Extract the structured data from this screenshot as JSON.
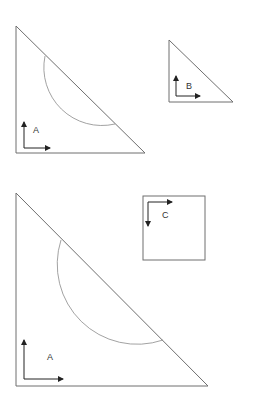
{
  "diagram": {
    "figures": [
      {
        "id": "triangle-a-small",
        "type": "right-triangle",
        "label": "A",
        "points": [
          [
            16,
            26
          ],
          [
            16,
            153
          ],
          [
            145,
            153
          ]
        ],
        "arc": {
          "from": [
            45,
            56
          ],
          "to": [
            115,
            124
          ]
        },
        "axes": {
          "origin": [
            24,
            148
          ],
          "up_to": [
            24,
            122
          ],
          "right_to": [
            50,
            148
          ]
        },
        "label_pos": [
          33,
          133
        ]
      },
      {
        "id": "triangle-b",
        "type": "right-triangle",
        "label": "B",
        "points": [
          [
            169,
            40
          ],
          [
            169,
            102
          ],
          [
            233,
            102
          ]
        ],
        "axes": {
          "origin": [
            176,
            96
          ],
          "up_to": [
            176,
            76
          ],
          "right_to": [
            200,
            96
          ]
        },
        "label_pos": [
          186,
          89
        ]
      },
      {
        "id": "square-c",
        "type": "square",
        "label": "C",
        "rect": [
          143,
          196,
          62,
          64
        ],
        "axes": {
          "origin": [
            148,
            202
          ],
          "down_to": [
            148,
            226
          ],
          "right_to": [
            172,
            202
          ]
        },
        "label_pos": [
          162,
          218
        ]
      },
      {
        "id": "triangle-a-large",
        "type": "right-triangle",
        "label": "A",
        "points": [
          [
            16,
            193
          ],
          [
            16,
            386
          ],
          [
            208,
            386
          ]
        ],
        "arc": {
          "from": [
            61,
            240
          ],
          "to": [
            163,
            340
          ]
        },
        "axes": {
          "origin": [
            24,
            379
          ],
          "up_to": [
            24,
            340
          ],
          "right_to": [
            63,
            379
          ]
        },
        "label_pos": [
          47,
          360
        ]
      }
    ],
    "colors": {
      "shape_stroke": "#6f6f6f",
      "arc_stroke": "#8a8a8a",
      "axis": "#222222",
      "background": "#ffffff"
    }
  }
}
